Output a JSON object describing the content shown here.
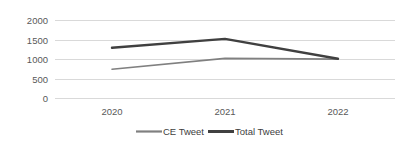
{
  "chart_data": {
    "type": "line",
    "title": "",
    "subtitle": "",
    "xlabel": "",
    "ylabel": "",
    "categories": [
      "2020",
      "2021",
      "2022"
    ],
    "series": [
      {
        "name": "CE Tweet",
        "values": [
          750,
          1030,
          1010
        ],
        "color": "#808080",
        "line_width": 1.6
      },
      {
        "name": "Total Tweet",
        "values": [
          1300,
          1530,
          1020
        ],
        "color": "#404040",
        "line_width": 2.4
      }
    ],
    "ylim": [
      0,
      2000
    ],
    "y_ticks": [
      "0",
      "500",
      "1000",
      "1500",
      "2000"
    ],
    "y_tick_values": [
      0,
      500,
      1000,
      1500,
      2000
    ],
    "x_tick_labels": [
      "2020",
      "2021",
      "2022"
    ],
    "grid": true,
    "grid_axis": "y",
    "grid_color": "#d9d9d9",
    "legend_position": "bottom",
    "markers": false,
    "background_color": "#ffffff"
  },
  "legend": {
    "entries": [
      {
        "label": "CE Tweet",
        "color": "#808080"
      },
      {
        "label": "Total Tweet",
        "color": "#404040"
      }
    ]
  }
}
